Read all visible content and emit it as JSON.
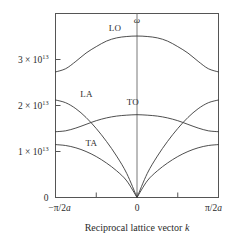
{
  "figure": {
    "omega_symbol": "ω",
    "x_axis_title_main": "Reciprocal lattice vector ",
    "x_axis_title_var": "k",
    "y_axis_ticks": [
      {
        "mantissa": "1 × 10",
        "exponent": "13",
        "value": 1.0
      },
      {
        "mantissa": "2 × 10",
        "exponent": "13",
        "value": 2.0
      },
      {
        "mantissa": "3 × 10",
        "exponent": "13",
        "value": 3.0
      }
    ],
    "y_zero_label": "0",
    "x_tick_labels": {
      "left": "−π/2a",
      "center": "0",
      "right": "π/2a"
    },
    "branch_labels": {
      "lo": "LO",
      "la": "LA",
      "to": "TO",
      "ta": "TA"
    },
    "colors": {
      "curve": "#3a3a3a",
      "axis": "#555555",
      "background": "#ffffff",
      "text": "#2b2b2b"
    }
  },
  "chart_data": {
    "type": "line",
    "title": "",
    "xlabel": "Reciprocal lattice vector k",
    "ylabel": "ω",
    "xlim": [
      -1,
      1
    ],
    "ylim": [
      0,
      4.0
    ],
    "x_unit": "π/2a",
    "y_unit": "10^13 rad/s",
    "grid": false,
    "legend": "inline-labels",
    "x": [
      -1.0,
      -0.875,
      -0.75,
      -0.625,
      -0.5,
      -0.375,
      -0.25,
      -0.125,
      0.0,
      0.125,
      0.25,
      0.375,
      0.5,
      0.625,
      0.75,
      0.875,
      1.0
    ],
    "series": [
      {
        "name": "LO",
        "label_x": -0.27,
        "label_y": 3.62,
        "values": [
          2.73,
          2.8,
          2.96,
          3.14,
          3.28,
          3.4,
          3.47,
          3.5,
          3.51,
          3.5,
          3.47,
          3.4,
          3.28,
          3.14,
          2.96,
          2.8,
          2.73
        ]
      },
      {
        "name": "TO",
        "label_x": -0.05,
        "label_y": 2.02,
        "values": [
          1.43,
          1.45,
          1.51,
          1.59,
          1.67,
          1.73,
          1.77,
          1.79,
          1.8,
          1.79,
          1.77,
          1.73,
          1.67,
          1.59,
          1.51,
          1.45,
          1.43
        ]
      },
      {
        "name": "LA",
        "label_x": -0.62,
        "label_y": 2.18,
        "values": [
          2.12,
          2.06,
          1.93,
          1.74,
          1.5,
          1.22,
          0.9,
          0.52,
          0.0,
          0.52,
          0.9,
          1.22,
          1.5,
          1.74,
          1.93,
          2.06,
          2.12
        ]
      },
      {
        "name": "TA",
        "label_x": -0.56,
        "label_y": 1.13,
        "values": [
          1.15,
          1.13,
          1.08,
          1.0,
          0.89,
          0.75,
          0.58,
          0.36,
          0.0,
          0.36,
          0.58,
          0.75,
          0.89,
          1.0,
          1.08,
          1.13,
          1.15
        ]
      }
    ],
    "y_ticks": [
      0,
      1,
      2,
      3
    ],
    "x_ticks": [
      -1,
      -0.5,
      0,
      0.5,
      1
    ]
  }
}
